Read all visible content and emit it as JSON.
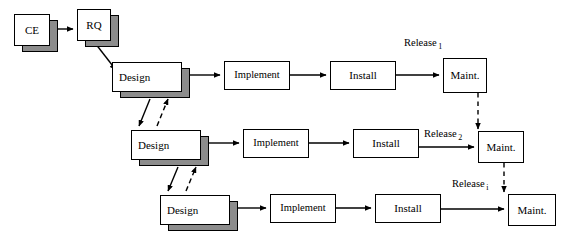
{
  "diagram": {
    "colors": {
      "background": "#ffffff",
      "stroke": "#000000",
      "shadow": "#8c8c8c",
      "box_fill": "#ffffff"
    },
    "stage_nodes": [
      {
        "id": "ce",
        "label": "CE",
        "x": 14,
        "y": 14,
        "w": 36,
        "h": 32,
        "stacked": true,
        "align": "center"
      },
      {
        "id": "rq",
        "label": "RQ",
        "x": 77,
        "y": 9,
        "w": 34,
        "h": 32,
        "stacked": true,
        "align": "center"
      },
      {
        "id": "design-1",
        "label": "Design",
        "x": 112,
        "y": 62,
        "w": 70,
        "h": 30,
        "stacked": true,
        "align": "left"
      },
      {
        "id": "implement-1",
        "label": "Implement",
        "x": 224,
        "y": 61,
        "w": 66,
        "h": 29,
        "stacked": false,
        "align": "center"
      },
      {
        "id": "install-1",
        "label": "Install",
        "x": 330,
        "y": 61,
        "w": 66,
        "h": 29,
        "stacked": false,
        "align": "center"
      },
      {
        "id": "maint-1",
        "label": "Maint.",
        "x": 443,
        "y": 58,
        "w": 44,
        "h": 35,
        "stacked": false,
        "align": "center"
      },
      {
        "id": "design-2",
        "label": "Design",
        "x": 131,
        "y": 130,
        "w": 70,
        "h": 30,
        "stacked": true,
        "align": "left"
      },
      {
        "id": "implement-2",
        "label": "Implement",
        "x": 243,
        "y": 129,
        "w": 66,
        "h": 29,
        "stacked": false,
        "align": "center"
      },
      {
        "id": "install-2",
        "label": "Install",
        "x": 353,
        "y": 129,
        "w": 66,
        "h": 29,
        "stacked": false,
        "align": "center"
      },
      {
        "id": "maint-2",
        "label": "Maint.",
        "x": 478,
        "y": 131,
        "w": 46,
        "h": 32,
        "stacked": false,
        "align": "center"
      },
      {
        "id": "design-3",
        "label": "Design",
        "x": 160,
        "y": 195,
        "w": 70,
        "h": 30,
        "stacked": true,
        "align": "left"
      },
      {
        "id": "implement-3",
        "label": "Implement",
        "x": 270,
        "y": 194,
        "w": 66,
        "h": 29,
        "stacked": false,
        "align": "center"
      },
      {
        "id": "install-3",
        "label": "Install",
        "x": 375,
        "y": 194,
        "w": 66,
        "h": 29,
        "stacked": false,
        "align": "center"
      },
      {
        "id": "maint-3",
        "label": "Maint.",
        "x": 508,
        "y": 194,
        "w": 48,
        "h": 32,
        "stacked": false,
        "align": "center"
      }
    ],
    "edge_labels": [
      {
        "id": "release-1",
        "text": "Release",
        "subscript": "1",
        "x": 404,
        "y": 37
      },
      {
        "id": "release-2",
        "text": "Release",
        "subscript": "2",
        "x": 424,
        "y": 128
      },
      {
        "id": "release-3",
        "text": "Release",
        "subscript": "i",
        "x": 452,
        "y": 178
      }
    ],
    "increments": [
      {
        "index": 1,
        "release_label": "Release",
        "release_subscript": "1",
        "stages": [
          "Design",
          "Implement",
          "Install",
          "Maint."
        ]
      },
      {
        "index": 2,
        "release_label": "Release",
        "release_subscript": "2",
        "stages": [
          "Design",
          "Implement",
          "Install",
          "Maint."
        ]
      },
      {
        "index": 3,
        "release_label": "Release",
        "release_subscript": "i",
        "stages": [
          "Design",
          "Implement",
          "Install",
          "Maint."
        ]
      }
    ],
    "entry_stages": [
      "CE",
      "RQ"
    ]
  }
}
